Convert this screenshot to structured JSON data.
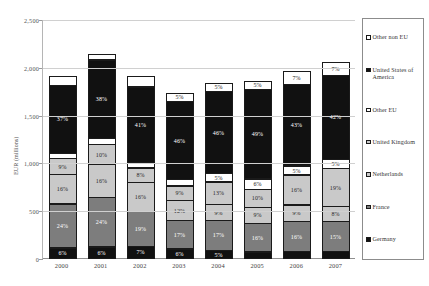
{
  "chart_data": {
    "type": "bar",
    "subtype": "stacked-percentage-labeled",
    "title": "",
    "xlabel": "",
    "ylabel": "EUR (millions)",
    "ylim": [
      0,
      2500
    ],
    "ytick_labels": [
      "2,500",
      "2,000",
      "1,500",
      "1,000",
      "500",
      "0"
    ],
    "ytick_values": [
      2500,
      2000,
      1500,
      1000,
      500,
      0
    ],
    "grid": true,
    "legend_position": "right",
    "categories": [
      "2000",
      "2001",
      "2002",
      "2003",
      "2004",
      "2005",
      "2006",
      "2007"
    ],
    "totals": [
      1950,
      2180,
      1950,
      1790,
      1880,
      1920,
      2000,
      2100
    ],
    "series": [
      {
        "name": "Germany",
        "color": "#111111",
        "swatch": "dark",
        "values": [
          6,
          6,
          7,
          6,
          5,
          4,
          4,
          4
        ],
        "labels": [
          "6%",
          "6%",
          "7%",
          "6%",
          "5%",
          "",
          "",
          ""
        ]
      },
      {
        "name": "France",
        "color": "#7d7d7d",
        "swatch": "mgray",
        "values": [
          24,
          24,
          19,
          17,
          17,
          16,
          16,
          15
        ],
        "labels": [
          "24%",
          "24%",
          "19%",
          "17%",
          "17%",
          "16%",
          "16%",
          "15%"
        ]
      },
      {
        "name": "Netherlands",
        "color": "#c9c9c9",
        "swatch": "lgray",
        "values": [
          16,
          16,
          16,
          12,
          9,
          9,
          9,
          8
        ],
        "labels": [
          "16%",
          "16%",
          "16%",
          "12%",
          "9%",
          "9%",
          "9%",
          "8%"
        ]
      },
      {
        "name": "United Kingdom",
        "color": "#c9c9c9",
        "swatch": "lgray",
        "values": [
          9,
          10,
          8,
          9,
          13,
          10,
          16,
          19
        ],
        "labels": [
          "9%",
          "10%",
          "8%",
          "9%",
          "13%",
          "10%",
          "16%",
          "19%"
        ]
      },
      {
        "name": "Other EU",
        "color": "#ffffff",
        "swatch": "white",
        "values": [
          3,
          3,
          3,
          4,
          5,
          6,
          5,
          5
        ],
        "labels": [
          "",
          "",
          "",
          "",
          "5%",
          "6%",
          "5%",
          "5%"
        ]
      },
      {
        "name": "United States of America",
        "color": "#111111",
        "swatch": "dark",
        "values": [
          37,
          38,
          41,
          46,
          46,
          49,
          43,
          42
        ],
        "labels": [
          "37%",
          "38%",
          "41%",
          "46%",
          "46%",
          "49%",
          "43%",
          "42%"
        ]
      },
      {
        "name": "Other non EU",
        "color": "#ffffff",
        "swatch": "white",
        "values": [
          5,
          3,
          6,
          5,
          5,
          5,
          7,
          7
        ],
        "labels": [
          "",
          "",
          "",
          "5%",
          "5%",
          "5%",
          "7%",
          "7%"
        ]
      }
    ],
    "legend_entries": [
      {
        "label": "Other non EU",
        "swatch": "white"
      },
      {
        "label": "United States of America",
        "swatch": "dark"
      },
      {
        "label": "Other EU",
        "swatch": "white"
      },
      {
        "label": "United Kingdom",
        "swatch": "lgray"
      },
      {
        "label": "Netherlands",
        "swatch": "lgray"
      },
      {
        "label": "France",
        "swatch": "mgray"
      },
      {
        "label": "Germany",
        "swatch": "dark"
      }
    ]
  }
}
